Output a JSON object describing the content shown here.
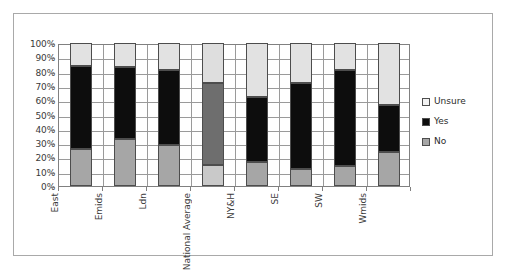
{
  "chart_data": {
    "type": "bar",
    "subtype": "100% stacked column",
    "title": "",
    "xlabel": "",
    "ylabel": "",
    "ylim": [
      0,
      100
    ],
    "y_tick_labels": [
      "100%",
      "90%",
      "80%",
      "70%",
      "60%",
      "50%",
      "40%",
      "30%",
      "20%",
      "10%",
      "0%"
    ],
    "y_tick_values": [
      100,
      90,
      80,
      70,
      60,
      50,
      40,
      30,
      20,
      10,
      0
    ],
    "grid": true,
    "legend_position": "right",
    "categories": [
      "East",
      "Emids",
      "Ldn",
      "National Average",
      "NY&H",
      "SE",
      "SW",
      "Wmids"
    ],
    "series": [
      {
        "name": "No",
        "color": "#a6a6a6",
        "values": [
          26,
          33,
          29,
          15,
          17,
          12,
          14,
          24
        ]
      },
      {
        "name": "Yes",
        "color": "#0d0d0d",
        "values": [
          58,
          50,
          52,
          57,
          45,
          60,
          67,
          33
        ]
      },
      {
        "name": "Unsure",
        "color": "#e2e2e2",
        "values": [
          16,
          17,
          19,
          28,
          38,
          28,
          19,
          43
        ]
      }
    ],
    "cumulative_tops": {
      "No": [
        26,
        33,
        29,
        15,
        17,
        12,
        14,
        24
      ],
      "Yes": [
        84,
        83,
        81,
        72,
        62,
        72,
        81,
        57
      ]
    },
    "legend_entries": [
      {
        "label": "Unsure",
        "swatch": "sw-unsure"
      },
      {
        "label": "Yes",
        "swatch": "sw-yes"
      },
      {
        "label": "No",
        "swatch": "sw-no"
      }
    ],
    "light_columns": [
      "National Average"
    ]
  }
}
